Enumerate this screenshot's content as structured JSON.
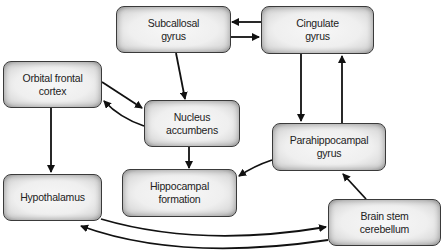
{
  "diagram": {
    "nodes": [
      {
        "id": "subcallosal",
        "line1": "Subcallosal",
        "line2": "gyrus"
      },
      {
        "id": "cingulate",
        "line1": "Cingulate",
        "line2": "gyrus"
      },
      {
        "id": "orbital",
        "line1": "Orbital frontal",
        "line2": "cortex"
      },
      {
        "id": "accumbens",
        "line1": "Nucleus",
        "line2": "accumbens"
      },
      {
        "id": "parahippocampal",
        "line1": "Parahippocampal",
        "line2": "gyrus"
      },
      {
        "id": "hypothalamus",
        "line1": "Hypothalamus",
        "line2": ""
      },
      {
        "id": "hippocampal",
        "line1": "Hippocampal",
        "line2": "formation"
      },
      {
        "id": "brainstem",
        "line1": "Brain stem",
        "line2": "cerebellum"
      }
    ],
    "edges": [
      {
        "from": "Cingulate gyrus",
        "to": "Subcallosal gyrus"
      },
      {
        "from": "Subcallosal gyrus",
        "to": "Cingulate gyrus"
      },
      {
        "from": "Subcallosal gyrus",
        "to": "Nucleus accumbens"
      },
      {
        "from": "Orbital frontal cortex",
        "to": "Nucleus accumbens"
      },
      {
        "from": "Nucleus accumbens",
        "to": "Orbital frontal cortex"
      },
      {
        "from": "Orbital frontal cortex",
        "to": "Hypothalamus"
      },
      {
        "from": "Nucleus accumbens",
        "to": "Hippocampal formation"
      },
      {
        "from": "Cingulate gyrus",
        "to": "Parahippocampal gyrus"
      },
      {
        "from": "Parahippocampal gyrus",
        "to": "Cingulate gyrus"
      },
      {
        "from": "Parahippocampal gyrus",
        "to": "Hippocampal formation"
      },
      {
        "from": "Brain stem cerebellum",
        "to": "Parahippocampal gyrus"
      },
      {
        "from": "Hypothalamus",
        "to": "Brain stem cerebellum"
      },
      {
        "from": "Brain stem cerebellum",
        "to": "Hypothalamus"
      }
    ]
  }
}
